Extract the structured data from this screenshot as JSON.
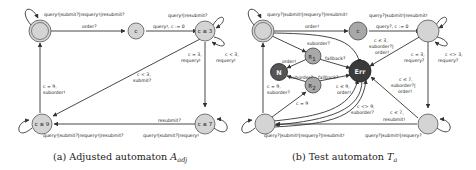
{
  "figure_a": {
    "caption_prefix": "(a) Adjusted automaton ",
    "caption_symbol": "A",
    "caption_sub": "adj",
    "states": {
      "init": "",
      "c": "c",
      "c_le_3": "c ≤ 3",
      "c_le_9": "c ≤ 9",
      "c_le_7": "c ≤ 7"
    },
    "edges": {
      "init_loop": "query!|submit?|requery!|resubmit?",
      "init_to_c": "order?",
      "c_to_c3": "query!, c := 0",
      "c3_loop_top": "query!|resubmit?",
      "c3_to_c7_line1": "c = 3,",
      "c3_to_c7_line2": "requery!",
      "c3_loop_right_line1": "c < 3,",
      "c3_loop_right_line2": "requery!",
      "c3_to_c9_line1": "c < 3,",
      "c3_to_c9_line2": "submit?",
      "c9_to_init_line1": "c = 9,",
      "c9_to_init_line2": "suborder!",
      "c7_to_c9": "resubmit?",
      "c9_loop": "query!|submit?|requery!|resubmit?",
      "c7_loop": "query!|submit?|requery!"
    }
  },
  "figure_b": {
    "caption_prefix": "(b) Test automaton ",
    "caption_symbol": "T",
    "caption_sub": "a",
    "states": {
      "init": "",
      "c": "c",
      "s3": "",
      "r1": "R",
      "r1_sub": "1",
      "r2": "R",
      "r2_sub": "2",
      "n": "N",
      "err": "Err",
      "s9": "",
      "s7": ""
    },
    "edges": {
      "init_loop": "query?|submit!|requery?|resubmit!",
      "init_to_c": "order!",
      "c_to_s3": "query?, c := 0",
      "s3_loop_top": "query?|submit!|resubmit!",
      "init_to_r1": "suborder?",
      "r1_to_n": "order!",
      "r1_to_err": "fallback?",
      "r2_to_n": "suborder?",
      "r2_to_err": "fallback?",
      "s3_to_err_line1": "c ≤ 3,",
      "s3_to_err_line2": "suborder?|",
      "s3_to_err_line3": "order!",
      "s3_to_s7_line1": "c = 3,",
      "s3_to_s7_line2": "requery?",
      "s3_loop_right_line1": "c <> 3,",
      "s3_loop_right_line2": "requery?",
      "s9_to_init_line1": "c = 9,",
      "s9_to_init_line2": "suborder?",
      "s9_to_r2": "c = 9",
      "s9_to_err_a_line1": "c ≤ 9,",
      "s9_to_err_a_line2": "order!",
      "s9_to_err_b_line1": "c <> 9,",
      "s9_to_err_b_line2": "suborder?",
      "s7_to_err_line1": "c ≤ 7,",
      "s7_to_err_line2": "suborder?|",
      "s7_to_err_line3": "order!",
      "s7_to_s9_line1": "c ≤ 7,",
      "s7_to_s9_line2": "resubmit!",
      "s9_loop": "query?|submit!|requery?|resubmit!",
      "s7_loop": "query?|submit!|requery?"
    }
  },
  "colors": {
    "state_fill": "#d4d4d4",
    "r_state_fill": "#a8a8a8",
    "n_state_fill": "#555555",
    "err_state_fill": "#3a3a3a",
    "edge": "#333333"
  }
}
